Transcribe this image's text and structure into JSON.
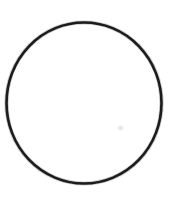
{
  "canvas": {
    "width": 180,
    "height": 202,
    "background_color": "#ffffff",
    "alt_text": "Hand-drawn black circle outline on a plain white background"
  },
  "figure": {
    "name": "circle-outline",
    "shape": "circle",
    "title": "Circle",
    "stroke_color": "#1a1a1a",
    "fill_color": "none",
    "stroke_width": 2.6,
    "center_x": 84,
    "center_y": 103,
    "radius_x": 77.5,
    "radius_y": 80.5,
    "bounds": {
      "left": 6,
      "top": 22,
      "right": 161,
      "bottom": 184
    }
  },
  "artifacts": {
    "speck": {
      "name": "faint-speck",
      "x": 117,
      "y": 125,
      "color": "#8c8c91",
      "opacity": 0.3
    }
  }
}
